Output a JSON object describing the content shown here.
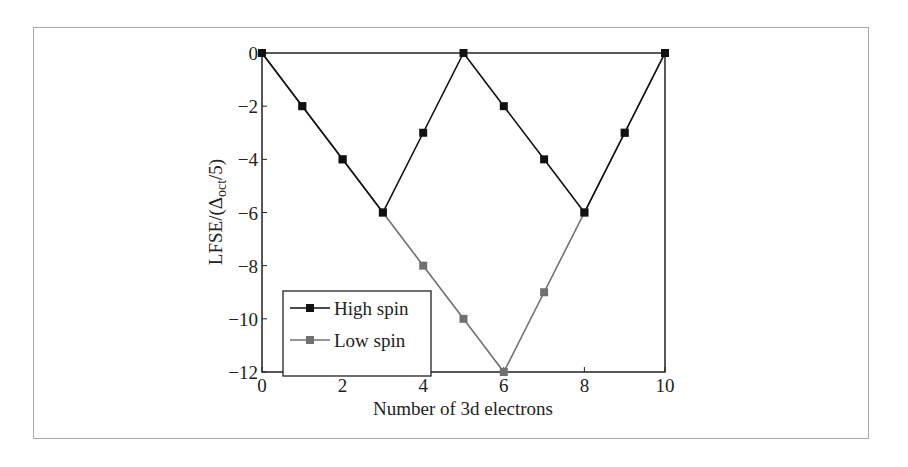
{
  "chart_data": {
    "type": "line",
    "title": "",
    "xlabel": "Number of 3d electrons",
    "ylabel": "LFSE/(Δoct/5)",
    "ylabel_parts": {
      "pre": "LFSE/(Δ",
      "sub": "oct",
      "post": "/5)"
    },
    "x": [
      0,
      1,
      2,
      3,
      4,
      5,
      6,
      7,
      8,
      9,
      10
    ],
    "xlim": [
      0,
      10
    ],
    "ylim": [
      -12,
      0
    ],
    "xticks": [
      "0",
      "2",
      "4",
      "6",
      "8",
      "10"
    ],
    "yticks": [
      "0",
      "−2",
      "−4",
      "−6",
      "−8",
      "−10",
      "−12"
    ],
    "grid": false,
    "legend_position": "lower left",
    "series": [
      {
        "name": "High spin",
        "color": "#111111",
        "values": [
          0,
          -2,
          -4,
          -6,
          -3,
          0,
          -2,
          -4,
          -6,
          -3,
          0
        ]
      },
      {
        "name": "Low spin",
        "color": "#707070",
        "values": [
          0,
          -2,
          -4,
          -6,
          -8,
          -10,
          -12,
          -9,
          -6,
          -3,
          0
        ]
      }
    ]
  },
  "legend": {
    "items": [
      {
        "label": "High spin"
      },
      {
        "label": "Low spin"
      }
    ]
  }
}
